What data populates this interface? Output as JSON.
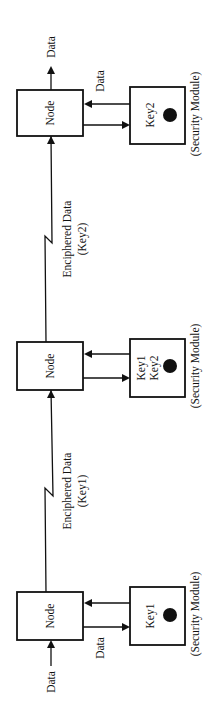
{
  "diagram": {
    "orientation": "rotated-90-ccw",
    "stages": [
      {
        "node_label": "Node",
        "module_keys": [
          "Key2"
        ],
        "module_caption": "(Security Module)",
        "side_data_label": "Data"
      },
      {
        "node_label": "Node",
        "module_keys": [
          "Key1",
          "Key2"
        ],
        "module_caption": "(Security Module)"
      },
      {
        "node_label": "Node",
        "module_keys": [
          "Key1"
        ],
        "module_caption": "(Security Module)",
        "side_data_label": "Data"
      }
    ],
    "links": [
      {
        "line1": "Enciphered Data",
        "line2": "(Key2)"
      },
      {
        "line1": "Enciphered Data",
        "line2": "(Key1)"
      }
    ],
    "output_label": "Data",
    "input_label": "Data",
    "colors": {
      "ink": "#111111",
      "background": "#ffffff"
    }
  }
}
